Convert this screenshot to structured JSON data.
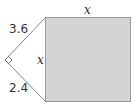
{
  "diagram": {
    "colors": {
      "square_fill": "#d4d4d4",
      "square_stroke": "#9a9a9a",
      "line": "#555555",
      "text": "#333333"
    },
    "labels": {
      "upper_leg": "3.6",
      "lower_leg": "2.4",
      "square_top": "x",
      "square_left": "x"
    },
    "right_angle_marker": true
  }
}
